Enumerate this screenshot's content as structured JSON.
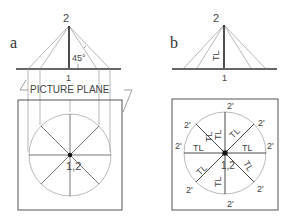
{
  "panel_a": {
    "label": "a",
    "point_top": "2",
    "point_bottom": "1",
    "angle_label": "45°",
    "plane_label": "PICTURE PLANE",
    "center_label": "1,2"
  },
  "panel_b": {
    "label": "b",
    "point_top": "2",
    "point_bottom": "1",
    "elevation_label": "TL",
    "center_label": "1,2",
    "radial_labels": [
      "TL",
      "TL",
      "TL",
      "TL",
      "TL",
      "TL",
      "TL",
      "TL"
    ],
    "rim_labels": [
      "2'",
      "2'",
      "2'",
      "2'",
      "2'",
      "2'",
      "2'",
      "2'"
    ]
  },
  "colors": {
    "line_dark": "#222222",
    "line_light": "#9a9a9a",
    "circle": "#aaaaaa",
    "ground": "#666666"
  }
}
